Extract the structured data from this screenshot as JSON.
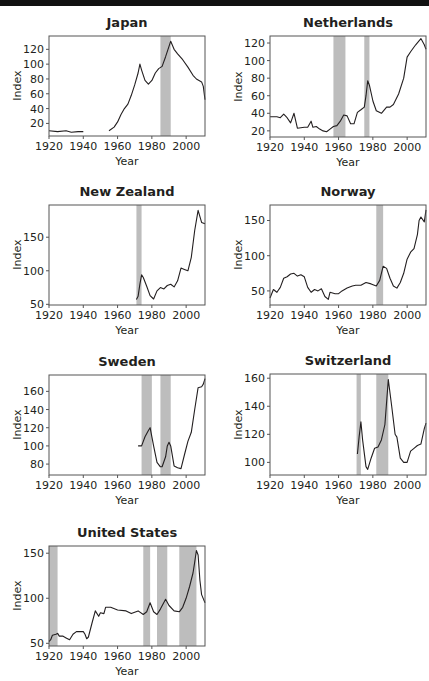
{
  "figure": {
    "shade_color": "#bdbdbd",
    "line_color": "#231f20",
    "frame_color": "#555555"
  },
  "chart_data": [
    {
      "type": "line",
      "title": "Japan",
      "xlabel": "Year",
      "ylabel": "Index",
      "xlim": [
        1920,
        2011
      ],
      "ylim": [
        3,
        138
      ],
      "xticks": [
        1920,
        1940,
        1960,
        1980,
        2000
      ],
      "yticks": [
        20,
        40,
        60,
        80,
        100,
        120
      ],
      "shaded": [
        [
          1985,
          1991
        ]
      ],
      "segments": [
        [
          [
            1920,
            10
          ],
          [
            1925,
            9
          ],
          [
            1930,
            10
          ],
          [
            1933,
            8
          ],
          [
            1937,
            9
          ],
          [
            1940,
            9
          ]
        ],
        [
          [
            1955,
            10
          ],
          [
            1958,
            15
          ],
          [
            1960,
            22
          ],
          [
            1962,
            32
          ],
          [
            1964,
            40
          ],
          [
            1966,
            46
          ],
          [
            1968,
            58
          ],
          [
            1970,
            72
          ],
          [
            1972,
            88
          ],
          [
            1973,
            100
          ],
          [
            1974,
            92
          ],
          [
            1976,
            78
          ],
          [
            1978,
            73
          ],
          [
            1980,
            78
          ],
          [
            1982,
            88
          ],
          [
            1984,
            94
          ],
          [
            1986,
            97
          ],
          [
            1988,
            110
          ],
          [
            1990,
            124
          ],
          [
            1991,
            131
          ],
          [
            1993,
            120
          ],
          [
            1995,
            114
          ],
          [
            1998,
            106
          ],
          [
            2001,
            96
          ],
          [
            2004,
            85
          ],
          [
            2006,
            80
          ],
          [
            2009,
            76
          ],
          [
            2010,
            70
          ],
          [
            2011,
            52
          ]
        ]
      ],
      "frame": {
        "left": 49,
        "top": 36,
        "width": 156,
        "height": 100
      }
    },
    {
      "type": "line",
      "title": "Netherlands",
      "xlabel": "Year",
      "ylabel": "Index",
      "xlim": [
        1920,
        2011
      ],
      "ylim": [
        13,
        128
      ],
      "xticks": [
        1920,
        1940,
        1960,
        1980,
        2000
      ],
      "yticks": [
        20,
        40,
        60,
        80,
        100,
        120
      ],
      "shaded": [
        [
          1957,
          1964
        ],
        [
          1975,
          1978
        ]
      ],
      "segments": [
        [
          [
            1920,
            36
          ],
          [
            1924,
            36
          ],
          [
            1926,
            35
          ],
          [
            1928,
            39
          ],
          [
            1930,
            35
          ],
          [
            1932,
            29
          ],
          [
            1934,
            40
          ],
          [
            1936,
            23
          ],
          [
            1940,
            24
          ],
          [
            1942,
            24
          ],
          [
            1944,
            31
          ],
          [
            1945,
            24
          ],
          [
            1947,
            25
          ],
          [
            1949,
            22
          ],
          [
            1951,
            20
          ],
          [
            1953,
            19
          ],
          [
            1955,
            22
          ],
          [
            1957,
            25
          ],
          [
            1959,
            26
          ],
          [
            1961,
            31
          ],
          [
            1963,
            38
          ],
          [
            1965,
            37
          ],
          [
            1967,
            28
          ],
          [
            1969,
            28
          ],
          [
            1971,
            41
          ],
          [
            1973,
            44
          ],
          [
            1975,
            47
          ],
          [
            1976,
            60
          ],
          [
            1977,
            77
          ],
          [
            1978,
            72
          ],
          [
            1980,
            54
          ],
          [
            1982,
            43
          ],
          [
            1985,
            40
          ],
          [
            1988,
            47
          ],
          [
            1990,
            47
          ],
          [
            1992,
            50
          ],
          [
            1995,
            62
          ],
          [
            1998,
            80
          ],
          [
            2000,
            104
          ],
          [
            2002,
            110
          ],
          [
            2005,
            118
          ],
          [
            2008,
            125
          ],
          [
            2010,
            118
          ],
          [
            2011,
            113
          ]
        ]
      ],
      "frame": {
        "left": 270,
        "top": 36,
        "width": 156,
        "height": 101
      }
    },
    {
      "type": "line",
      "title": "New Zealand",
      "xlabel": "Year",
      "ylabel": "Index",
      "xlim": [
        1920,
        2011
      ],
      "ylim": [
        49,
        198
      ],
      "xticks": [
        1920,
        1940,
        1960,
        1980,
        2000
      ],
      "yticks": [
        50,
        100,
        150
      ],
      "shaded": [
        [
          1971,
          1974
        ]
      ],
      "segments": [
        [
          [
            1971,
            57
          ],
          [
            1972,
            62
          ],
          [
            1973,
            80
          ],
          [
            1974,
            94
          ],
          [
            1975,
            90
          ],
          [
            1977,
            77
          ],
          [
            1979,
            63
          ],
          [
            1981,
            58
          ],
          [
            1983,
            70
          ],
          [
            1985,
            75
          ],
          [
            1987,
            73
          ],
          [
            1989,
            78
          ],
          [
            1991,
            80
          ],
          [
            1993,
            76
          ],
          [
            1995,
            85
          ],
          [
            1997,
            104
          ],
          [
            1999,
            102
          ],
          [
            2001,
            100
          ],
          [
            2003,
            120
          ],
          [
            2005,
            160
          ],
          [
            2007,
            190
          ],
          [
            2009,
            172
          ],
          [
            2011,
            170
          ]
        ]
      ],
      "frame": {
        "left": 49,
        "top": 205,
        "width": 156,
        "height": 100
      }
    },
    {
      "type": "line",
      "title": "Norway",
      "xlabel": "Year",
      "ylabel": "Index",
      "xlim": [
        1920,
        2011
      ],
      "ylim": [
        30,
        172
      ],
      "xticks": [
        1920,
        1940,
        1960,
        1980,
        2000
      ],
      "yticks": [
        50,
        100,
        150
      ],
      "shaded": [
        [
          1982,
          1986
        ]
      ],
      "segments": [
        [
          [
            1920,
            40
          ],
          [
            1922,
            52
          ],
          [
            1924,
            48
          ],
          [
            1926,
            55
          ],
          [
            1928,
            68
          ],
          [
            1930,
            70
          ],
          [
            1932,
            74
          ],
          [
            1934,
            75
          ],
          [
            1936,
            71
          ],
          [
            1938,
            73
          ],
          [
            1940,
            70
          ],
          [
            1942,
            55
          ],
          [
            1944,
            48
          ],
          [
            1946,
            52
          ],
          [
            1948,
            50
          ],
          [
            1950,
            53
          ],
          [
            1952,
            42
          ],
          [
            1954,
            38
          ],
          [
            1955,
            48
          ],
          [
            1958,
            46
          ],
          [
            1960,
            46
          ],
          [
            1962,
            50
          ],
          [
            1965,
            54
          ],
          [
            1968,
            57
          ],
          [
            1970,
            58
          ],
          [
            1973,
            58
          ],
          [
            1976,
            62
          ],
          [
            1979,
            60
          ],
          [
            1982,
            57
          ],
          [
            1984,
            65
          ],
          [
            1986,
            85
          ],
          [
            1988,
            82
          ],
          [
            1990,
            68
          ],
          [
            1992,
            57
          ],
          [
            1994,
            54
          ],
          [
            1996,
            62
          ],
          [
            1998,
            75
          ],
          [
            2000,
            95
          ],
          [
            2002,
            105
          ],
          [
            2004,
            110
          ],
          [
            2006,
            130
          ],
          [
            2007,
            150
          ],
          [
            2008,
            155
          ],
          [
            2010,
            148
          ],
          [
            2011,
            165
          ]
        ]
      ],
      "frame": {
        "left": 270,
        "top": 205,
        "width": 156,
        "height": 100
      }
    },
    {
      "type": "line",
      "title": "Sweden",
      "xlabel": "Year",
      "ylabel": "Index",
      "xlim": [
        1920,
        2011
      ],
      "ylim": [
        68,
        178
      ],
      "xticks": [
        1920,
        1940,
        1960,
        1980,
        2000
      ],
      "yticks": [
        80,
        100,
        120,
        140,
        160
      ],
      "shaded": [
        [
          1974,
          1980
        ],
        [
          1985,
          1991
        ]
      ],
      "segments": [
        [
          [
            1972,
            100
          ],
          [
            1974,
            100
          ],
          [
            1976,
            110
          ],
          [
            1978,
            117
          ],
          [
            1979,
            120
          ],
          [
            1981,
            100
          ],
          [
            1983,
            82
          ],
          [
            1985,
            77
          ],
          [
            1986,
            77
          ],
          [
            1988,
            88
          ],
          [
            1989,
            100
          ],
          [
            1990,
            104
          ],
          [
            1991,
            100
          ],
          [
            1993,
            78
          ],
          [
            1995,
            76
          ],
          [
            1997,
            75
          ],
          [
            1999,
            90
          ],
          [
            2001,
            105
          ],
          [
            2003,
            115
          ],
          [
            2005,
            140
          ],
          [
            2007,
            164
          ],
          [
            2009,
            165
          ],
          [
            2010,
            168
          ],
          [
            2011,
            174
          ]
        ]
      ],
      "frame": {
        "left": 49,
        "top": 375,
        "width": 156,
        "height": 100
      }
    },
    {
      "type": "line",
      "title": "Switzerland",
      "xlabel": "Year",
      "ylabel": "Index",
      "xlim": [
        1920,
        2011
      ],
      "ylim": [
        91,
        163
      ],
      "xticks": [
        1920,
        1940,
        1960,
        1980,
        2000
      ],
      "yticks": [
        100,
        120,
        140,
        160
      ],
      "shaded": [
        [
          1970.5,
          1973
        ],
        [
          1982,
          1989
        ]
      ],
      "segments": [
        [
          [
            1971,
            106
          ],
          [
            1972,
            118
          ],
          [
            1973,
            129
          ],
          [
            1974,
            116
          ],
          [
            1976,
            97
          ],
          [
            1977,
            95
          ],
          [
            1979,
            103
          ],
          [
            1981,
            110
          ],
          [
            1983,
            111
          ],
          [
            1985,
            116
          ],
          [
            1987,
            127
          ],
          [
            1989,
            159
          ],
          [
            1991,
            140
          ],
          [
            1993,
            120
          ],
          [
            1994,
            118
          ],
          [
            1996,
            103
          ],
          [
            1998,
            100
          ],
          [
            2000,
            100
          ],
          [
            2002,
            108
          ],
          [
            2004,
            110
          ],
          [
            2006,
            112
          ],
          [
            2008,
            113
          ],
          [
            2010,
            124
          ],
          [
            2011,
            128
          ]
        ]
      ],
      "frame": {
        "left": 270,
        "top": 374,
        "width": 156,
        "height": 101
      }
    },
    {
      "type": "line",
      "title": "United States",
      "xlabel": "Year",
      "ylabel": "Index",
      "xlim": [
        1920,
        2011
      ],
      "ylim": [
        47,
        158
      ],
      "xticks": [
        1920,
        1940,
        1960,
        1980,
        2000
      ],
      "yticks": [
        50,
        100,
        150
      ],
      "shaded": [
        [
          1920,
          1925
        ],
        [
          1975,
          1979
        ],
        [
          1983,
          1989
        ],
        [
          1996,
          2006
        ]
      ],
      "segments": [
        [
          [
            1920,
            52
          ],
          [
            1921,
            54
          ],
          [
            1922,
            59
          ],
          [
            1924,
            60
          ],
          [
            1925,
            61
          ],
          [
            1926,
            58
          ],
          [
            1928,
            58
          ],
          [
            1930,
            56
          ],
          [
            1932,
            54
          ],
          [
            1934,
            60
          ],
          [
            1936,
            63
          ],
          [
            1938,
            63
          ],
          [
            1940,
            63
          ],
          [
            1941,
            60
          ],
          [
            1942,
            55
          ],
          [
            1943,
            57
          ],
          [
            1945,
            72
          ],
          [
            1947,
            86
          ],
          [
            1949,
            80
          ],
          [
            1950,
            84
          ],
          [
            1952,
            83
          ],
          [
            1953,
            90
          ],
          [
            1956,
            90
          ],
          [
            1960,
            87
          ],
          [
            1965,
            86
          ],
          [
            1968,
            83
          ],
          [
            1972,
            86
          ],
          [
            1975,
            82
          ],
          [
            1977,
            85
          ],
          [
            1979,
            95
          ],
          [
            1981,
            85
          ],
          [
            1983,
            82
          ],
          [
            1985,
            88
          ],
          [
            1988,
            99
          ],
          [
            1990,
            92
          ],
          [
            1993,
            86
          ],
          [
            1996,
            85
          ],
          [
            1998,
            90
          ],
          [
            2000,
            100
          ],
          [
            2002,
            113
          ],
          [
            2004,
            128
          ],
          [
            2005,
            140
          ],
          [
            2006,
            153
          ],
          [
            2007,
            148
          ],
          [
            2008,
            120
          ],
          [
            2009,
            104
          ],
          [
            2011,
            95
          ]
        ]
      ],
      "frame": {
        "left": 49,
        "top": 546,
        "width": 156,
        "height": 100
      }
    }
  ]
}
